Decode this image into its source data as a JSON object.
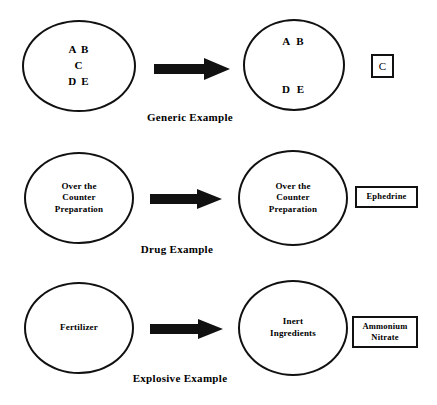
{
  "diagram": {
    "type": "process-flow",
    "rows": [
      {
        "id": "generic",
        "caption": "Generic Example",
        "source_circle": {
          "label": "A B\nC\nD E",
          "lines": [
            "A B",
            "C",
            "D E"
          ]
        },
        "result_circle": {
          "label": "A  B\n\nD  E",
          "lines": [
            "A  B",
            "D  E"
          ]
        },
        "extracted_box": {
          "label": "C"
        },
        "arrow": "right-arrow"
      },
      {
        "id": "drug",
        "caption": "Drug Example",
        "source_circle": {
          "label": "Over the\nCounter\nPreparation",
          "lines": [
            "Over the",
            "Counter",
            "Preparation"
          ]
        },
        "result_circle": {
          "label": "Over the\nCounter\nPreparation",
          "lines": [
            "Over the",
            "Counter",
            "Preparation"
          ]
        },
        "extracted_box": {
          "label": "Ephedrine"
        },
        "arrow": "right-arrow"
      },
      {
        "id": "explosive",
        "caption": "Explosive Example",
        "source_circle": {
          "label": "Fertilizer",
          "lines": [
            "Fertilizer"
          ]
        },
        "result_circle": {
          "label": "Inert\nIngredients",
          "lines": [
            "Inert",
            "Ingredients"
          ]
        },
        "extracted_box": {
          "label": "Ammonium\nNitrate"
        },
        "arrow": "right-arrow"
      }
    ],
    "colors": {
      "background": "#ffffff",
      "stroke": "#111111",
      "text": "#000000"
    }
  }
}
